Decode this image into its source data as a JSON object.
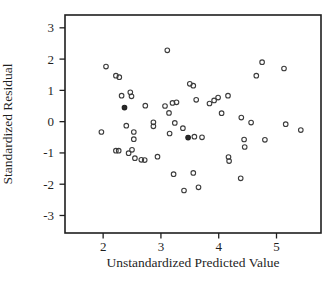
{
  "chart_data": {
    "type": "scatter",
    "title": "",
    "xlabel": "Unstandardized Predicted Value",
    "ylabel": "Standardized Residual",
    "xticks": [
      2,
      3,
      4,
      5
    ],
    "yticks": [
      3,
      2,
      1,
      0,
      -1,
      -2,
      -3
    ],
    "xlim": [
      1.34,
      5.77
    ],
    "ylim": [
      -3.56,
      3.41
    ],
    "grid": false,
    "legend": "none",
    "marker": "open-circle",
    "marker_color": "#3c3c3c",
    "frame_color": "#1f1f1f",
    "points": [
      [
        3.11,
        2.28
      ],
      [
        2.05,
        1.76
      ],
      [
        4.75,
        1.9
      ],
      [
        5.13,
        1.7
      ],
      [
        4.65,
        1.47
      ],
      [
        2.22,
        1.47
      ],
      [
        2.28,
        1.42
      ],
      [
        3.5,
        1.21
      ],
      [
        3.56,
        1.15
      ],
      [
        2.47,
        0.94
      ],
      [
        2.49,
        0.81
      ],
      [
        2.32,
        0.83
      ],
      [
        3.61,
        0.7
      ],
      [
        3.84,
        0.58
      ],
      [
        3.92,
        0.68
      ],
      [
        3.99,
        0.77
      ],
      [
        4.16,
        0.83
      ],
      [
        2.73,
        0.51
      ],
      [
        3.07,
        0.5
      ],
      [
        3.2,
        0.6
      ],
      [
        3.27,
        0.62
      ],
      [
        3.14,
        0.28
      ],
      [
        4.05,
        0.27
      ],
      [
        4.39,
        0.13
      ],
      [
        2.4,
        -0.13
      ],
      [
        2.87,
        -0.02
      ],
      [
        2.87,
        -0.15
      ],
      [
        3.24,
        -0.04
      ],
      [
        4.56,
        -0.03
      ],
      [
        5.16,
        -0.08
      ],
      [
        1.97,
        -0.33
      ],
      [
        2.53,
        -0.33
      ],
      [
        2.53,
        -0.56
      ],
      [
        3.38,
        -0.21
      ],
      [
        3.15,
        -0.38
      ],
      [
        5.42,
        -0.27
      ],
      [
        3.58,
        -0.48
      ],
      [
        3.71,
        -0.5
      ],
      [
        4.44,
        -0.57
      ],
      [
        4.8,
        -0.58
      ],
      [
        4.45,
        -0.81
      ],
      [
        2.22,
        -0.93
      ],
      [
        2.27,
        -0.93
      ],
      [
        2.44,
        -1.01
      ],
      [
        2.5,
        -0.9
      ],
      [
        2.55,
        -1.17
      ],
      [
        2.66,
        -1.22
      ],
      [
        2.72,
        -1.23
      ],
      [
        2.94,
        -1.12
      ],
      [
        4.17,
        -1.13
      ],
      [
        4.18,
        -1.26
      ],
      [
        3.22,
        -1.68
      ],
      [
        3.56,
        -1.64
      ],
      [
        4.38,
        -1.81
      ],
      [
        3.4,
        -2.2
      ],
      [
        3.65,
        -2.1
      ]
    ],
    "bold_points": [
      [
        2.37,
        0.45
      ],
      [
        3.47,
        -0.51
      ]
    ]
  }
}
